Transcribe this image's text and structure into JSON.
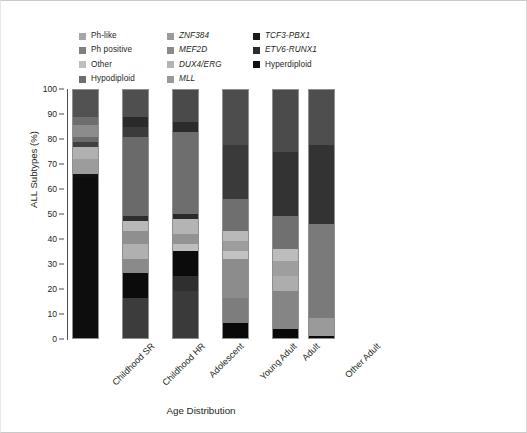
{
  "legend": {
    "entries": [
      {
        "label": "Ph-like",
        "color": "#a6a6a6",
        "italic": false,
        "col": 0
      },
      {
        "label": "Ph positive",
        "color": "#808080",
        "italic": false,
        "col": 0
      },
      {
        "label": "Other",
        "color": "#bfbfbf",
        "italic": false,
        "col": 0
      },
      {
        "label": "Hypodiploid",
        "color": "#6e6e6e",
        "italic": false,
        "col": 0
      },
      {
        "label": "ZNF384",
        "color": "#9a9a9a",
        "italic": true,
        "col": 1
      },
      {
        "label": "MEF2D",
        "color": "#8a8a8a",
        "italic": true,
        "col": 1
      },
      {
        "label": "DUX4/ERG",
        "color": "#b3b3b3",
        "italic": true,
        "col": 1
      },
      {
        "label": "MLL",
        "color": "#999999",
        "italic": true,
        "col": 1
      },
      {
        "label": "TCF3-PBX1",
        "color": "#1a1a1a",
        "italic": true,
        "col": 2
      },
      {
        "label": "ETV6-RUNX1",
        "color": "#2b2b2b",
        "italic": true,
        "col": 2
      },
      {
        "label": "Hyperdiploid",
        "color": "#111111",
        "italic": false,
        "col": 2
      }
    ]
  },
  "axes": {
    "ylabel": "ALL Subtypes (%)",
    "xlabel": "Age Distribution",
    "yticks": [
      0,
      10,
      20,
      30,
      40,
      50,
      60,
      70,
      80,
      90,
      100
    ],
    "ylim": [
      0,
      100
    ]
  },
  "chart_data": {
    "type": "bar",
    "stacked": true,
    "title": "",
    "xlabel": "Age Distribution",
    "ylabel": "ALL Subtypes (%)",
    "ylim": [
      0,
      100
    ],
    "grid": false,
    "legend_position": "top",
    "categories": [
      "Childhood SR",
      "Childhood HR",
      "Adolescent",
      "Young Adult",
      "Adult",
      "Other Adult"
    ],
    "series": [
      {
        "name": "Ph-like",
        "color": "#a6a6a6",
        "values": [
          3.0,
          10.0,
          11.0,
          10.0,
          9.0,
          0.0
        ]
      },
      {
        "name": "Ph positive",
        "color": "#808080",
        "values": [
          1.5,
          4.0,
          6.0,
          8.0,
          19.0,
          0.0
        ]
      },
      {
        "name": "Other",
        "color": "#bfbfbf",
        "values": [
          6.0,
          9.0,
          8.0,
          10.0,
          9.0,
          0.0
        ]
      },
      {
        "name": "Hypodiploid",
        "color": "#6e6e6e",
        "values": [
          1.0,
          2.0,
          2.0,
          3.0,
          2.0,
          0.0
        ]
      },
      {
        "name": "ZNF384",
        "color": "#9a9a9a",
        "values": [
          1.5,
          3.0,
          4.0,
          5.0,
          5.0,
          0.0
        ]
      },
      {
        "name": "MEF2D",
        "color": "#8a8a8a",
        "values": [
          2.0,
          3.0,
          3.0,
          4.0,
          4.0,
          0.0
        ]
      },
      {
        "name": "DUX4/ERG",
        "color": "#b3b3b3",
        "values": [
          4.0,
          8.0,
          9.0,
          9.0,
          7.0,
          45.0
        ]
      },
      {
        "name": "MLL",
        "color": "#999999",
        "values": [
          1.0,
          1.0,
          1.0,
          2.0,
          2.0,
          0.0
        ]
      },
      {
        "name": "TCF3-PBX1",
        "color": "#1a1a1a",
        "values": [
          4.0,
          5.0,
          5.0,
          4.0,
          3.0,
          0.0
        ]
      },
      {
        "name": "ETV6-RUNX1",
        "color": "#2b2b2b",
        "values": [
          60.0,
          29.0,
          21.0,
          39.0,
          36.0,
          54.0
        ]
      },
      {
        "name": "Hyperdiploid",
        "color": "#111111",
        "values": [
          16.0,
          26.0,
          30.0,
          6.0,
          4.0,
          1.0
        ]
      }
    ],
    "stacks": [
      {
        "category": "Childhood SR",
        "segments": [
          {
            "name": "Ph-like",
            "color": "#525252",
            "pct": 11.0
          },
          {
            "name": "Ph positive",
            "color": "#6e6e6e",
            "pct": 3.0
          },
          {
            "name": "Other",
            "color": "#8c8c8c",
            "pct": 5.0
          },
          {
            "name": "Hypodiploid",
            "color": "#6b6b6b",
            "pct": 2.0
          },
          {
            "name": "ZNF384",
            "color": "#404040",
            "pct": 2.0
          },
          {
            "name": "MEF2D",
            "color": "#b0b0b0",
            "pct": 5.0
          },
          {
            "name": "DUX4/ERG",
            "color": "#9c9c9c",
            "pct": 6.0
          },
          {
            "name": "MLL",
            "color": "#111111",
            "pct": 1.0
          },
          {
            "name": "TCF3-PBX1",
            "color": "#0d0d0d",
            "pct": 65.0
          }
        ]
      },
      {
        "category": "Childhood HR",
        "segments": [
          {
            "name": "Ph-like",
            "color": "#4f4f4f",
            "pct": 11.0
          },
          {
            "name": "Ph positive",
            "color": "#2a2a2a",
            "pct": 4.0
          },
          {
            "name": "Other",
            "color": "#3b3b3b",
            "pct": 4.0
          },
          {
            "name": "Hypodiploid",
            "color": "#6a6a6a",
            "pct": 32.0
          },
          {
            "name": "ZNF384",
            "color": "#2e2e2e",
            "pct": 2.0
          },
          {
            "name": "MEF2D",
            "color": "#b8b8b8",
            "pct": 4.0
          },
          {
            "name": "DUX4/ERG",
            "color": "#8f8f8f",
            "pct": 5.0
          },
          {
            "name": "MLL",
            "color": "#b0b0b0",
            "pct": 6.0
          },
          {
            "name": "TCF3-PBX1",
            "color": "#8a8a8a",
            "pct": 6.0
          },
          {
            "name": "ETV6-RUNX1",
            "color": "#0b0b0b",
            "pct": 10.0
          },
          {
            "name": "Hyperdiploid",
            "color": "#3c3c3c",
            "pct": 16.0
          }
        ]
      },
      {
        "category": "Adolescent",
        "segments": [
          {
            "name": "Ph-like",
            "color": "#4a4a4a",
            "pct": 13.0
          },
          {
            "name": "Ph positive",
            "color": "#2b2b2b",
            "pct": 4.0
          },
          {
            "name": "Other",
            "color": "#6e6e6e",
            "pct": 33.0
          },
          {
            "name": "Hypodiploid",
            "color": "#2a2a2a",
            "pct": 2.0
          },
          {
            "name": "ZNF384",
            "color": "#b4b4b4",
            "pct": 6.0
          },
          {
            "name": "MEF2D",
            "color": "#939393",
            "pct": 4.0
          },
          {
            "name": "DUX4/ERG",
            "color": "#bdbdbd",
            "pct": 3.0
          },
          {
            "name": "MLL",
            "color": "#0b0b0b",
            "pct": 10.0
          },
          {
            "name": "ETV6-RUNX1",
            "color": "#2f2f2f",
            "pct": 6.0
          },
          {
            "name": "Hyperdiploid",
            "color": "#3a3a3a",
            "pct": 19.0
          }
        ]
      },
      {
        "category": "Young Adult",
        "segments": [
          {
            "name": "Ph-like",
            "color": "#4d4d4d",
            "pct": 22.0
          },
          {
            "name": "Ph positive",
            "color": "#3a3a3a",
            "pct": 22.0
          },
          {
            "name": "Other",
            "color": "#6f6f6f",
            "pct": 13.0
          },
          {
            "name": "Hypodiploid",
            "color": "#b9b9b9",
            "pct": 4.0
          },
          {
            "name": "ZNF384",
            "color": "#9d9d9d",
            "pct": 4.0
          },
          {
            "name": "MEF2D",
            "color": "#c2c2c2",
            "pct": 3.0
          },
          {
            "name": "DUX4/ERG",
            "color": "#8c8c8c",
            "pct": 16.0
          },
          {
            "name": "MLL",
            "color": "#7d7d7d",
            "pct": 10.0
          },
          {
            "name": "Hyperdiploid",
            "color": "#090909",
            "pct": 6.0
          }
        ]
      },
      {
        "category": "Adult",
        "segments": [
          {
            "name": "Ph-like",
            "color": "#4b4b4b",
            "pct": 25.0
          },
          {
            "name": "Ph positive",
            "color": "#333333",
            "pct": 26.0
          },
          {
            "name": "Other",
            "color": "#707070",
            "pct": 13.0
          },
          {
            "name": "Hypodiploid",
            "color": "#bcbcbc",
            "pct": 5.0
          },
          {
            "name": "ZNF384",
            "color": "#9e9e9e",
            "pct": 6.0
          },
          {
            "name": "MEF2D",
            "color": "#adadad",
            "pct": 6.0
          },
          {
            "name": "DUX4/ERG",
            "color": "#858585",
            "pct": 15.5
          },
          {
            "name": "Hyperdiploid",
            "color": "#090909",
            "pct": 3.5
          }
        ]
      },
      {
        "category": "Other Adult",
        "segments": [
          {
            "name": "Ph-like",
            "color": "#4e4e4e",
            "pct": 22.0
          },
          {
            "name": "Ph positive",
            "color": "#333333",
            "pct": 32.0
          },
          {
            "name": "Other",
            "color": "#7a7a7a",
            "pct": 38.0
          },
          {
            "name": "DUX4/ERG",
            "color": "#9a9a9a",
            "pct": 7.0
          },
          {
            "name": "Hyperdiploid",
            "color": "#0a0a0a",
            "pct": 1.0
          }
        ]
      }
    ]
  }
}
